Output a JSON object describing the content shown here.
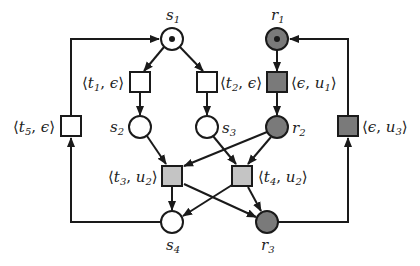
{
  "diagram": {
    "type": "petri-net",
    "colors": {
      "white": "#ffffff",
      "dark_grey": "#7a7a7a",
      "light_grey": "#c4c4c4",
      "stroke": "#1a1a1a"
    },
    "places": [
      {
        "id": "s1",
        "label": "s",
        "sub": "1",
        "fill": "white",
        "token": true
      },
      {
        "id": "s2",
        "label": "s",
        "sub": "2",
        "fill": "white",
        "token": false
      },
      {
        "id": "s3",
        "label": "s",
        "sub": "3",
        "fill": "white",
        "token": false
      },
      {
        "id": "s4",
        "label": "s",
        "sub": "4",
        "fill": "white",
        "token": false
      },
      {
        "id": "r1",
        "label": "r",
        "sub": "1",
        "fill": "dark_grey",
        "token": true
      },
      {
        "id": "r2",
        "label": "r",
        "sub": "2",
        "fill": "dark_grey",
        "token": false
      },
      {
        "id": "r3",
        "label": "r",
        "sub": "3",
        "fill": "dark_grey",
        "token": false
      }
    ],
    "transitions": [
      {
        "id": "t1e",
        "label": "⟨t₁, ϵ⟩",
        "fill": "white"
      },
      {
        "id": "t2e",
        "label": "⟨t₂, ϵ⟩",
        "fill": "white"
      },
      {
        "id": "t5e",
        "label": "⟨t₅, ϵ⟩",
        "fill": "white"
      },
      {
        "id": "eu1",
        "label": "⟨ϵ, u₁⟩",
        "fill": "dark_grey"
      },
      {
        "id": "eu3",
        "label": "⟨ϵ, u₃⟩",
        "fill": "dark_grey"
      },
      {
        "id": "t3u2",
        "label": "⟨t₃, u₂⟩",
        "fill": "light_grey"
      },
      {
        "id": "t4u2",
        "label": "⟨t₄, u₂⟩",
        "fill": "light_grey"
      }
    ],
    "arcs": [
      {
        "from": "s1",
        "to": "t1e"
      },
      {
        "from": "s1",
        "to": "t2e"
      },
      {
        "from": "t1e",
        "to": "s2"
      },
      {
        "from": "t2e",
        "to": "s3"
      },
      {
        "from": "r1",
        "to": "eu1"
      },
      {
        "from": "eu1",
        "to": "r2"
      },
      {
        "from": "s2",
        "to": "t3u2"
      },
      {
        "from": "s3",
        "to": "t4u2"
      },
      {
        "from": "r2",
        "to": "t3u2"
      },
      {
        "from": "r2",
        "to": "t4u2"
      },
      {
        "from": "t3u2",
        "to": "s4"
      },
      {
        "from": "t3u2",
        "to": "r3"
      },
      {
        "from": "t4u2",
        "to": "s4"
      },
      {
        "from": "t4u2",
        "to": "r3"
      },
      {
        "from": "s4",
        "to": "t5e"
      },
      {
        "from": "t5e",
        "to": "s1"
      },
      {
        "from": "r3",
        "to": "eu3"
      },
      {
        "from": "eu3",
        "to": "r1"
      }
    ]
  },
  "labels": {
    "s1": {
      "main": "s",
      "sub": "1"
    },
    "s2": {
      "main": "s",
      "sub": "2"
    },
    "s3": {
      "main": "s",
      "sub": "3"
    },
    "s4": {
      "main": "s",
      "sub": "4"
    },
    "r1": {
      "main": "r",
      "sub": "1"
    },
    "r2": {
      "main": "r",
      "sub": "2"
    },
    "r3": {
      "main": "r",
      "sub": "3"
    },
    "t1e": {
      "open": "⟨",
      "a": "t",
      "asub": "1",
      "sep": ", ",
      "b": "ϵ",
      "bsub": "",
      "close": "⟩"
    },
    "t2e": {
      "open": "⟨",
      "a": "t",
      "asub": "2",
      "sep": ", ",
      "b": "ϵ",
      "bsub": "",
      "close": "⟩"
    },
    "t5e": {
      "open": "⟨",
      "a": "t",
      "asub": "5",
      "sep": ", ",
      "b": "ϵ",
      "bsub": "",
      "close": "⟩"
    },
    "eu1": {
      "open": "⟨",
      "a": "ϵ",
      "asub": "",
      "sep": ", ",
      "b": "u",
      "bsub": "1",
      "close": "⟩"
    },
    "eu3": {
      "open": "⟨",
      "a": "ϵ",
      "asub": "",
      "sep": ", ",
      "b": "u",
      "bsub": "3",
      "close": "⟩"
    },
    "t3u2": {
      "open": "⟨",
      "a": "t",
      "asub": "3",
      "sep": ", ",
      "b": "u",
      "bsub": "2",
      "close": "⟩"
    },
    "t4u2": {
      "open": "⟨",
      "a": "t",
      "asub": "4",
      "sep": ", ",
      "b": "u",
      "bsub": "2",
      "close": "⟩"
    }
  }
}
